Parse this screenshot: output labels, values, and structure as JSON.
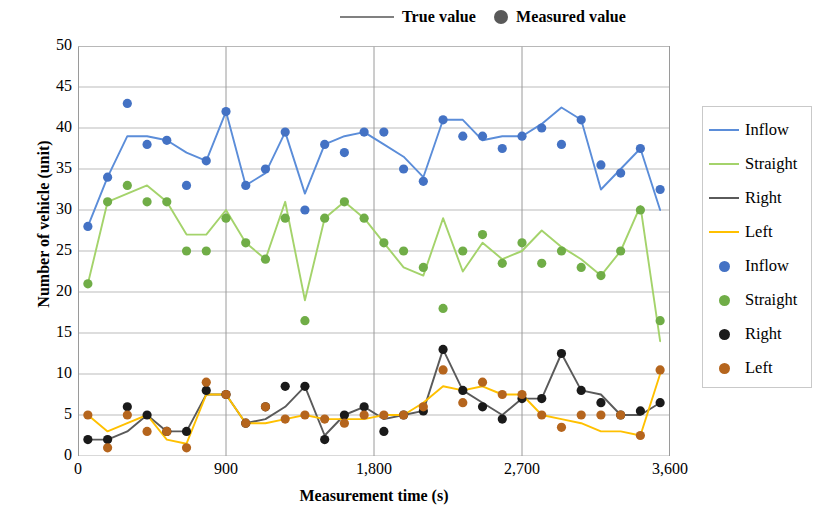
{
  "top_legend": [
    {
      "icon": "line-swatch",
      "label": "True value"
    },
    {
      "icon": "dot-swatch",
      "label": "Measured value"
    }
  ],
  "axes": {
    "y_title": "Number of vehicle (unit)",
    "x_title": "Measurement time (s)",
    "y_ticks": [
      "0",
      "5",
      "10",
      "15",
      "20",
      "25",
      "30",
      "35",
      "40",
      "45",
      "50"
    ],
    "x_ticks": [
      "0",
      "900",
      "1,800",
      "2,700",
      "3,600"
    ]
  },
  "right_legend": [
    {
      "type": "line",
      "label": "Inflow",
      "color": "#5B8DD9"
    },
    {
      "type": "line",
      "label": "Straight",
      "color": "#A4D36B"
    },
    {
      "type": "line",
      "label": "Right",
      "color": "#5A5A5A"
    },
    {
      "type": "line",
      "label": "Left",
      "color": "#FFC000"
    },
    {
      "type": "marker",
      "label": "Inflow",
      "color": "#4472C4"
    },
    {
      "type": "marker",
      "label": "Straight",
      "color": "#70AD47"
    },
    {
      "type": "marker",
      "label": "Right",
      "color": "#1A1A1A"
    },
    {
      "type": "marker",
      "label": "Left",
      "color": "#B5651D"
    }
  ],
  "chart_data": {
    "type": "line",
    "title": "",
    "xlabel": "Measurement time (s)",
    "ylabel": "Number of vehicle (unit)",
    "xlim": [
      0,
      3600
    ],
    "ylim": [
      0,
      50
    ],
    "y_tick_step": 5,
    "x_tick_step": 900,
    "grid": true,
    "legend_position": "right",
    "x": [
      60,
      180,
      300,
      420,
      540,
      660,
      780,
      900,
      1020,
      1140,
      1260,
      1380,
      1500,
      1620,
      1740,
      1860,
      1980,
      2100,
      2220,
      2340,
      2460,
      2580,
      2700,
      2820,
      2940,
      3060,
      3180,
      3300,
      3420,
      3540
    ],
    "series": [
      {
        "name": "Inflow",
        "kind": "true-line",
        "color": "#5B8DD9",
        "values": [
          28,
          34,
          39,
          39,
          38.5,
          37,
          36,
          42,
          33,
          34.5,
          39.5,
          32,
          38,
          39,
          39.5,
          38,
          36.5,
          34,
          41,
          41,
          38.5,
          39,
          39,
          40.5,
          42.5,
          41,
          32.5,
          35,
          37.5,
          30
        ]
      },
      {
        "name": "Straight",
        "kind": "true-line",
        "color": "#A4D36B",
        "values": [
          21,
          31,
          32,
          33,
          31,
          27,
          27,
          30,
          26,
          24,
          31,
          19,
          29,
          31,
          29,
          26,
          23,
          22,
          29,
          22.5,
          26,
          24,
          25,
          27.5,
          25.5,
          24,
          22,
          25,
          30.5,
          14
        ]
      },
      {
        "name": "Right",
        "kind": "true-line",
        "color": "#5A5A5A",
        "values": [
          2,
          2,
          3,
          5,
          3,
          3,
          7.5,
          7.5,
          4,
          4.5,
          6,
          8.5,
          2.5,
          5,
          6,
          4.5,
          5,
          5.5,
          13,
          8,
          6.5,
          5,
          7,
          7,
          12.5,
          8,
          7.5,
          5,
          5,
          6.5
        ]
      },
      {
        "name": "Left",
        "kind": "true-line",
        "color": "#FFC000",
        "values": [
          5,
          3,
          4,
          5,
          2,
          1.5,
          7.5,
          7.5,
          4,
          4,
          4.5,
          5,
          4.5,
          4.5,
          4.5,
          5,
          5,
          6.5,
          8.5,
          8,
          8.5,
          7.5,
          7.5,
          5,
          4.5,
          4,
          3,
          3,
          2.5,
          10
        ]
      },
      {
        "name": "Inflow",
        "kind": "measured-marker",
        "color": "#4472C4",
        "values": [
          28,
          34,
          43,
          38,
          38.5,
          33,
          36,
          42,
          33,
          35,
          39.5,
          30,
          38,
          37,
          39.5,
          39.5,
          35,
          33.5,
          41,
          39,
          39,
          37.5,
          39,
          40,
          38,
          41,
          35.5,
          34.5,
          37.5,
          32.5
        ]
      },
      {
        "name": "Straight",
        "kind": "measured-marker",
        "color": "#70AD47",
        "values": [
          21,
          31,
          33,
          31,
          31,
          25,
          25,
          29,
          26,
          24,
          29,
          16.5,
          29,
          31,
          29,
          26,
          25,
          23,
          18,
          25,
          27,
          23.5,
          26,
          23.5,
          25,
          23,
          22,
          25,
          30,
          16.5
        ]
      },
      {
        "name": "Right",
        "kind": "measured-marker",
        "color": "#1A1A1A",
        "values": [
          2,
          2,
          6,
          5,
          3,
          3,
          8,
          7.5,
          4,
          6,
          8.5,
          8.5,
          2,
          5,
          6,
          3,
          5,
          5.5,
          13,
          8,
          6,
          4.5,
          7,
          7,
          12.5,
          8,
          6.5,
          5,
          5.5,
          6.5
        ]
      },
      {
        "name": "Left",
        "kind": "measured-marker",
        "color": "#B5651D",
        "values": [
          5,
          1,
          5,
          3,
          3,
          1,
          9,
          7.5,
          4,
          6,
          4.5,
          5,
          4.5,
          4,
          5,
          5,
          5,
          6,
          10.5,
          6.5,
          9,
          7.5,
          7.5,
          5,
          3.5,
          5,
          5,
          5,
          2.5,
          10.5
        ]
      }
    ]
  }
}
